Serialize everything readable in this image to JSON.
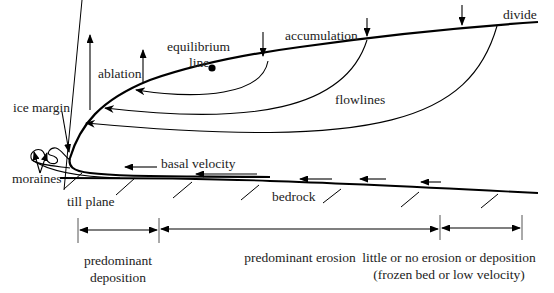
{
  "diagram": {
    "colors": {
      "line": "#000000",
      "text": "#222222",
      "background": "#ffffff"
    },
    "labels": {
      "divide": "divide",
      "accumulation": "accumulation",
      "equilibrium_line_1": "equilibrium",
      "equilibrium_line_2": "line",
      "ablation": "ablation",
      "ice_margin": "ice margin",
      "flowlines": "flowlines",
      "basal_velocity": "basal velocity",
      "moraines": "moraines",
      "till_plane": "till plane",
      "bedrock": "bedrock"
    },
    "zones": [
      {
        "label_lines": [
          "predominant",
          "deposition"
        ]
      },
      {
        "label_lines": [
          "predominant erosion"
        ]
      },
      {
        "label_lines": [
          "little or no erosion or deposition",
          "(frozen bed or low velocity)"
        ]
      }
    ],
    "symbols": {
      "accumulation_arrows": 3,
      "ablation_arrows": 2,
      "flowline_arrows": 3,
      "basal_velocity_arrows": 5,
      "bedrock_hatches": 8,
      "equilibrium_point": "filled-circle"
    }
  }
}
